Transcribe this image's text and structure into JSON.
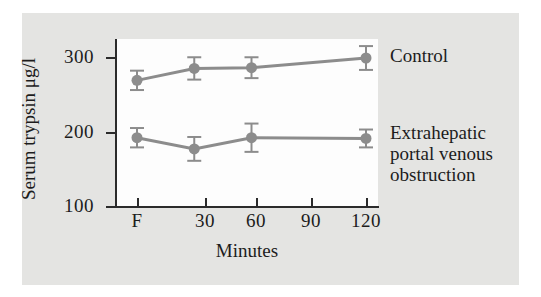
{
  "figure": {
    "background_color": "#e4e4e2",
    "plot_background_color": "#fdfdfd",
    "axis_color": "#2b2b2b",
    "series_color": "#8c8c8c"
  },
  "chart_data": {
    "type": "line",
    "title": "",
    "subtitle": "",
    "xlabel": "Minutes",
    "ylabel": "Serum trypsin μg/l",
    "x": [
      0,
      30,
      60,
      120
    ],
    "x_tick_positions": [
      0,
      30,
      60,
      90,
      120
    ],
    "x_tick_labels": [
      "F",
      "30",
      "60",
      "90",
      "120"
    ],
    "xlim": [
      -10,
      130
    ],
    "y_tick_values": [
      100,
      200,
      300
    ],
    "y_tick_labels": [
      "100",
      "200",
      "300"
    ],
    "ylim": [
      100,
      325
    ],
    "grid": false,
    "legend_position": "right-inline-labels",
    "error_bars": "vertical, with caps (mean ± SEM)",
    "marker": "filled circle",
    "series": [
      {
        "name": "Control",
        "label": "Control",
        "color": "#8c8c8c",
        "values": [
          270,
          286,
          287,
          300
        ],
        "errors": [
          13,
          15,
          14,
          16
        ]
      },
      {
        "name": "Extrahepatic portal venous obstruction",
        "label_lines": [
          "Extrahepatic",
          "portal venous",
          "obstruction"
        ],
        "color": "#8c8c8c",
        "values": [
          193,
          178,
          193,
          192
        ],
        "errors": [
          13,
          16,
          19,
          12
        ]
      }
    ]
  },
  "axes": {
    "y_title": "Serum trypsin μg/l",
    "x_title": "Minutes",
    "y_ticks": [
      "300",
      "200",
      "100"
    ],
    "x_ticks": [
      "F",
      "30",
      "60",
      "90",
      "120"
    ]
  },
  "labels": {
    "control": "Control",
    "ehpvo_line1": "Extrahepatic",
    "ehpvo_line2": "portal venous",
    "ehpvo_line3": "obstruction"
  }
}
